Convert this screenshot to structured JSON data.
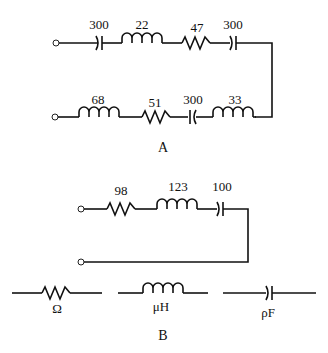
{
  "circuit_a": {
    "caption": "A",
    "top_row": [
      {
        "type": "capacitor",
        "value": "300"
      },
      {
        "type": "inductor",
        "value": "22"
      },
      {
        "type": "resistor",
        "value": "47"
      },
      {
        "type": "capacitor",
        "value": "300"
      }
    ],
    "bottom_row": [
      {
        "type": "inductor",
        "value": "68"
      },
      {
        "type": "resistor",
        "value": "51"
      },
      {
        "type": "capacitor",
        "value": "300"
      },
      {
        "type": "inductor",
        "value": "33"
      }
    ]
  },
  "circuit_b": {
    "caption": "B",
    "top_row": [
      {
        "type": "resistor",
        "value": "98"
      },
      {
        "type": "inductor",
        "value": "123"
      },
      {
        "type": "capacitor",
        "value": "100"
      }
    ]
  },
  "legend": [
    {
      "type": "resistor",
      "unit": "Ω"
    },
    {
      "type": "inductor",
      "unit": "μH"
    },
    {
      "type": "capacitor",
      "unit": "ρF"
    }
  ]
}
